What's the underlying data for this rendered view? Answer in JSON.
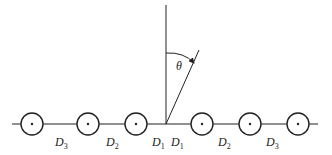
{
  "diagram": {
    "type": "antenna array / line of sources with observation angle",
    "colors": {
      "stroke": "#222222",
      "background": "#ffffff"
    },
    "axis_line": {
      "x1": 12,
      "x2": 318,
      "y": 124
    },
    "vertical_line": {
      "x": 166,
      "y1": 5,
      "y2": 124
    },
    "inclined_line": {
      "x1": 166,
      "y1": 124,
      "x2": 199,
      "y2": 50
    },
    "angle": {
      "symbol": "θ",
      "label_x": 176,
      "label_y": 70,
      "arc_start": {
        "x": 166,
        "y": 53
      },
      "arc_end": {
        "x": 194,
        "y": 63
      }
    },
    "elements": [
      {
        "cx": 32,
        "cy": 124,
        "r": 11
      },
      {
        "cx": 88,
        "cy": 124,
        "r": 11
      },
      {
        "cx": 136,
        "cy": 124,
        "r": 11
      },
      {
        "cx": 202,
        "cy": 124,
        "r": 11
      },
      {
        "cx": 250,
        "cy": 124,
        "r": 11
      },
      {
        "cx": 298,
        "cy": 124,
        "r": 11
      }
    ],
    "spacing_labels": [
      {
        "base": "D",
        "sub": "3",
        "x": 55,
        "y": 146
      },
      {
        "base": "D",
        "sub": "2",
        "x": 106,
        "y": 146
      },
      {
        "base": "D",
        "sub": "1",
        "x": 152,
        "y": 146
      },
      {
        "base": "D",
        "sub": "1",
        "x": 171,
        "y": 146
      },
      {
        "base": "D",
        "sub": "2",
        "x": 218,
        "y": 146
      },
      {
        "base": "D",
        "sub": "3",
        "x": 266,
        "y": 146
      }
    ]
  }
}
